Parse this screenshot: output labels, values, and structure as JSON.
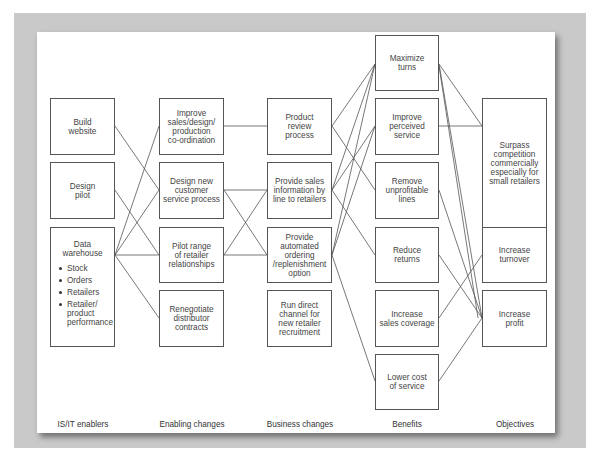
{
  "columns": [
    {
      "id": "c1",
      "header": "IS/IT enablers"
    },
    {
      "id": "c2",
      "header": "Enabling changes"
    },
    {
      "id": "c3",
      "header": "Business changes"
    },
    {
      "id": "c4",
      "header": "Benefits"
    },
    {
      "id": "c5",
      "header": "Objectives"
    }
  ],
  "nodes": {
    "build_website": "Build\nwebsite",
    "design_pilot": "Design\npilot",
    "data_warehouse": {
      "title": "Data\nwarehouse",
      "items": [
        "Stock",
        "Orders",
        "Retailers",
        "Retailer/\nproduct\nperformance"
      ]
    },
    "improve_sales": "Improve\nsales/design/\nproduction\nco-ordination",
    "design_new_customer": "Design new\ncustomer\nservice process",
    "pilot_range": "Pilot range\nof retailer\nrelationships",
    "renegotiate": "Renegotiate\ndistributor\ncontracts",
    "product_review": "Product\nreview\nprocess",
    "provide_sales_info": "Provide sales\ninformation by\nline to retailers",
    "provide_automated": "Provide\nautomated\nordering\n/replenishment\noption",
    "run_direct": "Run direct\nchannel for\nnew retailer\nrecruitment",
    "maximize_turns": "Maximize\nturns",
    "improve_perceived": "Improve\nperceived\nservice",
    "remove_unprofitable": "Remove\nunprofitable\nlines",
    "reduce_returns": "Reduce\nreturns",
    "increase_sales_coverage": "Increase\nsales coverage",
    "lower_cost": "Lower cost\nof service",
    "surpass": "Surpass\ncompetition\ncommercially\nespecially for\nsmall retailers",
    "increase_turnover": "Increase\nturnover",
    "increase_profit": "Increase\nprofit"
  },
  "edges": [
    [
      "build_website",
      "design_new_customer"
    ],
    [
      "design_pilot",
      "pilot_range"
    ],
    [
      "data_warehouse",
      "improve_sales"
    ],
    [
      "data_warehouse",
      "design_new_customer"
    ],
    [
      "data_warehouse",
      "pilot_range"
    ],
    [
      "data_warehouse",
      "renegotiate"
    ],
    [
      "improve_sales",
      "product_review"
    ],
    [
      "design_new_customer",
      "provide_sales_info"
    ],
    [
      "design_new_customer",
      "provide_automated"
    ],
    [
      "pilot_range",
      "provide_sales_info"
    ],
    [
      "pilot_range",
      "provide_automated"
    ],
    [
      "product_review",
      "maximize_turns"
    ],
    [
      "product_review",
      "remove_unprofitable"
    ],
    [
      "provide_sales_info",
      "maximize_turns"
    ],
    [
      "provide_sales_info",
      "improve_perceived"
    ],
    [
      "provide_sales_info",
      "reduce_returns"
    ],
    [
      "provide_automated",
      "maximize_turns"
    ],
    [
      "provide_automated",
      "improve_perceived"
    ],
    [
      "provide_automated",
      "lower_cost"
    ],
    [
      "maximize_turns",
      "surpass"
    ],
    [
      "maximize_turns",
      "increase_profit"
    ],
    [
      "maximize_turns",
      "increase_profit"
    ],
    [
      "improve_perceived",
      "surpass"
    ],
    [
      "remove_unprofitable",
      "increase_profit"
    ],
    [
      "reduce_returns",
      "increase_profit"
    ],
    [
      "increase_sales_coverage",
      "increase_turnover"
    ],
    [
      "lower_cost",
      "increase_profit"
    ]
  ]
}
